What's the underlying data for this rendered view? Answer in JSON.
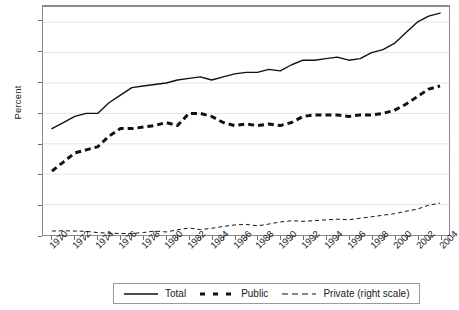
{
  "chart_data": {
    "type": "line",
    "title": "",
    "subtitle": "",
    "xlabel": "",
    "ylabel": "Percent",
    "y_right_label": "",
    "grid": true,
    "legend_position": "bottom",
    "xlim": [
      1970,
      2004
    ],
    "ylim": [
      1.5,
      9.0
    ],
    "y_ticks": [
      "8.5",
      "7.5",
      "6.5",
      "5.5",
      "4.5",
      "3.5",
      "2.5",
      "1.5"
    ],
    "y_tick_values": [
      8.5,
      7.5,
      6.5,
      5.5,
      4.5,
      3.5,
      2.5,
      1.5
    ],
    "x": [
      1970,
      1971,
      1972,
      1973,
      1974,
      1975,
      1976,
      1977,
      1978,
      1979,
      1980,
      1981,
      1982,
      1983,
      1984,
      1985,
      1986,
      1987,
      1988,
      1989,
      1990,
      1991,
      1992,
      1993,
      1994,
      1995,
      1996,
      1997,
      1998,
      1999,
      2000,
      2001,
      2002,
      2003,
      2004
    ],
    "x_tick_labels": [
      "1970",
      "1972",
      "1974",
      "1976",
      "1978",
      "1980",
      "1982",
      "1984",
      "1986",
      "1988",
      "1990",
      "1992",
      "1994",
      "1996",
      "1998",
      "2000",
      "2002",
      "2004"
    ],
    "series": [
      {
        "name": "Total",
        "style": "solid",
        "color": "#111111",
        "axis": "left",
        "values": [
          5.0,
          5.2,
          5.4,
          5.5,
          5.5,
          5.85,
          6.1,
          6.35,
          6.4,
          6.45,
          6.5,
          6.6,
          6.65,
          6.7,
          6.6,
          6.7,
          6.8,
          6.85,
          6.85,
          6.95,
          6.9,
          7.1,
          7.25,
          7.25,
          7.3,
          7.35,
          7.25,
          7.3,
          7.5,
          7.6,
          7.8,
          8.15,
          8.5,
          8.7,
          8.8
        ]
      },
      {
        "name": "Public",
        "style": "thick-dashed",
        "color": "#111111",
        "axis": "left",
        "values": [
          3.6,
          3.9,
          4.2,
          4.3,
          4.4,
          4.75,
          5.0,
          5.0,
          5.05,
          5.1,
          5.2,
          5.1,
          5.5,
          5.5,
          5.4,
          5.2,
          5.1,
          5.15,
          5.1,
          5.15,
          5.1,
          5.2,
          5.4,
          5.45,
          5.45,
          5.45,
          5.4,
          5.45,
          5.45,
          5.5,
          5.6,
          5.8,
          6.05,
          6.3,
          6.4
        ]
      },
      {
        "name": "Private (right scale)",
        "style": "thin-dashed",
        "color": "#111111",
        "axis": "right",
        "values": [
          1.63,
          1.64,
          1.63,
          1.62,
          1.58,
          1.56,
          1.55,
          1.55,
          1.58,
          1.63,
          1.6,
          1.67,
          1.73,
          1.68,
          1.72,
          1.78,
          1.83,
          1.85,
          1.8,
          1.86,
          1.93,
          1.97,
          1.95,
          1.97,
          2.0,
          2.02,
          2.0,
          2.05,
          2.1,
          2.15,
          2.2,
          2.28,
          2.35,
          2.48,
          2.55
        ]
      }
    ]
  },
  "legend": {
    "entries": [
      {
        "label": "Total",
        "style": "solid"
      },
      {
        "label": "Public",
        "style": "thick-dashed"
      },
      {
        "label": "Private (right scale)",
        "style": "thin-dashed"
      }
    ]
  }
}
